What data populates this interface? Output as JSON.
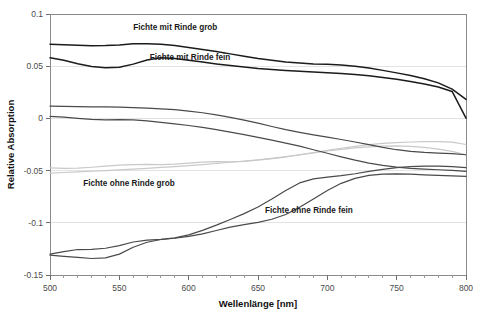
{
  "chart_data": {
    "type": "line",
    "title": "",
    "xlabel": "Wellenlänge [nm]",
    "ylabel": "Relative Absorption",
    "xlim": [
      500,
      800
    ],
    "ylim": [
      -0.15,
      0.1
    ],
    "xticks": [
      500,
      550,
      600,
      650,
      700,
      750,
      800
    ],
    "yticks": [
      0.1,
      0.05,
      0,
      -0.05,
      -0.1,
      -0.15
    ],
    "ytick_labels": [
      "0.1",
      "0.05",
      "0",
      "-0.05",
      "-0.1",
      "-0.15"
    ],
    "xtick_labels": [
      "500",
      "550",
      "600",
      "650",
      "700",
      "750",
      "800"
    ],
    "grid": true,
    "legend": "inline-annotations",
    "x": [
      500,
      510,
      520,
      530,
      540,
      550,
      560,
      570,
      580,
      590,
      600,
      610,
      620,
      630,
      640,
      650,
      660,
      670,
      680,
      690,
      700,
      710,
      720,
      730,
      740,
      750,
      760,
      770,
      780,
      790,
      800
    ],
    "series": [
      {
        "name": "Fichte mit Rinde grob (a)",
        "color": "#1b1b1b",
        "values": [
          0.071,
          0.0706,
          0.07,
          0.0696,
          0.0698,
          0.0704,
          0.0714,
          0.0716,
          0.071,
          0.0698,
          0.068,
          0.066,
          0.064,
          0.0618,
          0.0596,
          0.0574,
          0.0556,
          0.054,
          0.053,
          0.0522,
          0.0518,
          0.0512,
          0.05,
          0.0482,
          0.046,
          0.0436,
          0.041,
          0.038,
          0.034,
          0.028,
          0.0182
        ]
      },
      {
        "name": "Fichte mit Rinde grob (b)",
        "color": "#1b1b1b",
        "values": [
          0.058,
          0.0556,
          0.0524,
          0.0498,
          0.0486,
          0.049,
          0.052,
          0.056,
          0.058,
          0.0574,
          0.0558,
          0.054,
          0.0522,
          0.0506,
          0.0492,
          0.0478,
          0.0468,
          0.046,
          0.0452,
          0.0444,
          0.0438,
          0.043,
          0.042,
          0.0408,
          0.0392,
          0.0374,
          0.0354,
          0.033,
          0.03,
          0.0258,
          0.0002
        ]
      },
      {
        "name": "Fichte mit Rinde fein (a)",
        "color": "#4a4a4a",
        "values": [
          0.0118,
          0.0116,
          0.0112,
          0.011,
          0.011,
          0.0108,
          0.0104,
          0.0098,
          0.0092,
          0.0084,
          0.007,
          0.0054,
          0.0034,
          0.001,
          -0.0016,
          -0.0046,
          -0.0078,
          -0.0108,
          -0.0134,
          -0.0158,
          -0.018,
          -0.0202,
          -0.0226,
          -0.0252,
          -0.0278,
          -0.03,
          -0.0316,
          -0.0326,
          -0.0332,
          -0.0338,
          -0.0348
        ]
      },
      {
        "name": "Fichte mit Rinde fein (b)",
        "color": "#4a4a4a",
        "values": [
          0.002,
          0.0012,
          0.0,
          -0.001,
          -0.0014,
          -0.0012,
          -0.0014,
          -0.0024,
          -0.0038,
          -0.0052,
          -0.0068,
          -0.0086,
          -0.0108,
          -0.0132,
          -0.0156,
          -0.0182,
          -0.0208,
          -0.0236,
          -0.0266,
          -0.03,
          -0.0334,
          -0.0368,
          -0.04,
          -0.0428,
          -0.045,
          -0.0466,
          -0.0478,
          -0.0486,
          -0.0492,
          -0.0498,
          -0.0508
        ]
      },
      {
        "name": "Fichte ohne Rinde grob (a)",
        "color": "#c9c9c9",
        "values": [
          -0.0474,
          -0.0478,
          -0.0476,
          -0.0468,
          -0.0458,
          -0.0448,
          -0.0442,
          -0.044,
          -0.0442,
          -0.0438,
          -0.0428,
          -0.0418,
          -0.0414,
          -0.0416,
          -0.0412,
          -0.04,
          -0.0386,
          -0.037,
          -0.035,
          -0.0328,
          -0.0306,
          -0.0286,
          -0.0268,
          -0.0252,
          -0.024,
          -0.0232,
          -0.0226,
          -0.0222,
          -0.0222,
          -0.0228,
          -0.025
        ]
      },
      {
        "name": "Fichte ohne Rinde grob (b)",
        "color": "#c9c9c9",
        "values": [
          -0.0524,
          -0.0518,
          -0.0512,
          -0.0506,
          -0.05,
          -0.0494,
          -0.0486,
          -0.0478,
          -0.047,
          -0.0462,
          -0.0452,
          -0.0442,
          -0.0432,
          -0.042,
          -0.0408,
          -0.0396,
          -0.0382,
          -0.0366,
          -0.0348,
          -0.033,
          -0.0312,
          -0.0296,
          -0.0282,
          -0.0272,
          -0.0266,
          -0.0264,
          -0.0268,
          -0.0278,
          -0.0294,
          -0.0316,
          -0.035
        ]
      },
      {
        "name": "Fichte ohne Rinde fein (a)",
        "color": "#4a4a4a",
        "values": [
          -0.13,
          -0.1276,
          -0.1256,
          -0.1254,
          -0.1244,
          -0.1218,
          -0.1184,
          -0.1166,
          -0.1158,
          -0.1144,
          -0.1116,
          -0.1072,
          -0.1022,
          -0.0968,
          -0.0912,
          -0.0848,
          -0.0772,
          -0.069,
          -0.0618,
          -0.058,
          -0.0562,
          -0.0548,
          -0.053,
          -0.0508,
          -0.0488,
          -0.0472,
          -0.0462,
          -0.0458,
          -0.0458,
          -0.0462,
          -0.0472
        ]
      },
      {
        "name": "Fichte ohne Rinde fein (b)",
        "color": "#4a4a4a",
        "values": [
          -0.131,
          -0.1322,
          -0.1332,
          -0.1342,
          -0.1336,
          -0.13,
          -0.1234,
          -0.1186,
          -0.116,
          -0.1148,
          -0.113,
          -0.1106,
          -0.1074,
          -0.1042,
          -0.1018,
          -0.0996,
          -0.0966,
          -0.092,
          -0.0852,
          -0.0772,
          -0.069,
          -0.0622,
          -0.0574,
          -0.0546,
          -0.0534,
          -0.0532,
          -0.0534,
          -0.054,
          -0.0546,
          -0.055,
          -0.0556
        ]
      }
    ],
    "annotations": [
      {
        "text": "Fichte mit Rinde grob",
        "x": 560,
        "y": 0.088
      },
      {
        "text": "Fichte mit Rinde fein",
        "x": 572,
        "y": 0.059
      },
      {
        "text": "Fichte ohne Rinde grob",
        "x": 524,
        "y": -0.062
      },
      {
        "text": "Fichte ohne Rinde fein",
        "x": 655,
        "y": -0.088
      }
    ]
  },
  "caption": {
    "partial_text": ""
  }
}
